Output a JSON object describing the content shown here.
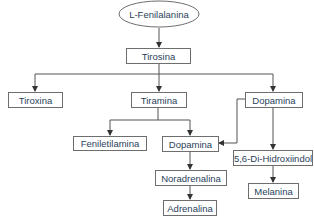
{
  "diagram": {
    "type": "metabolic-pathway-flowchart",
    "nodes": {
      "l_fenilalanina": "L-Fenilalanina",
      "tirosina": "Tirosina",
      "tiroxina": "Tiroxina",
      "tiramina": "Tiramina",
      "dopamina_right": "Dopamina",
      "feniletilamina": "Feniletilamina",
      "dopamina_mid": "Dopamina",
      "dihidroxiindol": "5,6-Di-Hidroxiindol",
      "noradrenalina": "Noradrenalina",
      "melanina": "Melanina",
      "adrenalina": "Adrenalina"
    },
    "edges": [
      {
        "from": "L-Fenilalanina",
        "to": "Tirosina"
      },
      {
        "from": "Tirosina",
        "to": "Tiroxina"
      },
      {
        "from": "Tirosina",
        "to": "Tiramina"
      },
      {
        "from": "Tirosina",
        "to": "Dopamina"
      },
      {
        "from": "Tiramina",
        "to": "Feniletilamina"
      },
      {
        "from": "Tiramina",
        "to": "Dopamina"
      },
      {
        "from": "Dopamina",
        "to": "Dopamina"
      },
      {
        "from": "Dopamina",
        "to": "5,6-Di-Hidroxiindol"
      },
      {
        "from": "Dopamina",
        "to": "Noradrenalina"
      },
      {
        "from": "5,6-Di-Hidroxiindol",
        "to": "Melanina"
      },
      {
        "from": "Noradrenalina",
        "to": "Adrenalina"
      }
    ],
    "colors": {
      "text": "#2a3f5a",
      "stroke": "#6e6e6e",
      "edge": "#555555"
    }
  }
}
